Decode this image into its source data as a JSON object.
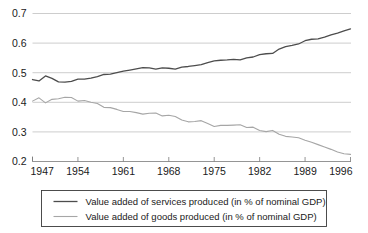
{
  "chart_data": {
    "type": "line",
    "title": "",
    "xlabel": "",
    "ylabel": "",
    "xlim": [
      1947,
      1996
    ],
    "ylim": [
      0.2,
      0.7
    ],
    "grid": true,
    "legend_position": "bottom",
    "y_ticks": [
      "0.7",
      "0.6",
      "0.5",
      "0.4",
      "0.3",
      "0.2"
    ],
    "y_tick_values": [
      0.7,
      0.6,
      0.5,
      0.4,
      0.3,
      0.2
    ],
    "x_ticks": [
      "1947",
      "1954",
      "1961",
      "1968",
      "1975",
      "1982",
      "1989",
      "1996"
    ],
    "x_tick_values": [
      1947,
      1954,
      1961,
      1968,
      1975,
      1982,
      1989,
      1996
    ],
    "x": [
      1947,
      1948,
      1949,
      1950,
      1951,
      1952,
      1953,
      1954,
      1955,
      1956,
      1957,
      1958,
      1959,
      1960,
      1961,
      1962,
      1963,
      1964,
      1965,
      1966,
      1967,
      1968,
      1969,
      1970,
      1971,
      1972,
      1973,
      1974,
      1975,
      1976,
      1977,
      1978,
      1979,
      1980,
      1981,
      1982,
      1983,
      1984,
      1985,
      1986,
      1987,
      1988,
      1989,
      1990,
      1991,
      1992,
      1993,
      1994,
      1995,
      1996
    ],
    "series": [
      {
        "name": "Value added of services produced (in % of nominal GDP)",
        "color": "#4d4d4d",
        "width": 1.3,
        "values": [
          0.477,
          0.472,
          0.489,
          0.481,
          0.469,
          0.468,
          0.471,
          0.478,
          0.478,
          0.482,
          0.487,
          0.494,
          0.495,
          0.5,
          0.505,
          0.509,
          0.513,
          0.517,
          0.516,
          0.512,
          0.516,
          0.515,
          0.512,
          0.519,
          0.521,
          0.524,
          0.527,
          0.534,
          0.54,
          0.542,
          0.543,
          0.545,
          0.543,
          0.55,
          0.553,
          0.561,
          0.564,
          0.565,
          0.58,
          0.588,
          0.592,
          0.597,
          0.608,
          0.613,
          0.614,
          0.62,
          0.628,
          0.634,
          0.641,
          0.648
        ]
      },
      {
        "name": "Value added of goods produced (in % of nominal GDP)",
        "color": "#a6a6a6",
        "width": 1.1,
        "values": [
          0.404,
          0.415,
          0.398,
          0.41,
          0.412,
          0.417,
          0.416,
          0.404,
          0.406,
          0.4,
          0.396,
          0.383,
          0.382,
          0.376,
          0.369,
          0.369,
          0.365,
          0.36,
          0.363,
          0.364,
          0.354,
          0.356,
          0.352,
          0.34,
          0.334,
          0.335,
          0.338,
          0.328,
          0.318,
          0.322,
          0.322,
          0.323,
          0.324,
          0.315,
          0.316,
          0.305,
          0.301,
          0.305,
          0.292,
          0.285,
          0.283,
          0.28,
          0.272,
          0.265,
          0.257,
          0.249,
          0.241,
          0.232,
          0.226,
          0.224
        ]
      }
    ]
  },
  "legend": {
    "items": [
      {
        "label": "Value added of services produced (in % of nominal GDP)"
      },
      {
        "label": "Value added of goods produced (in % of nominal GDP)"
      }
    ]
  }
}
